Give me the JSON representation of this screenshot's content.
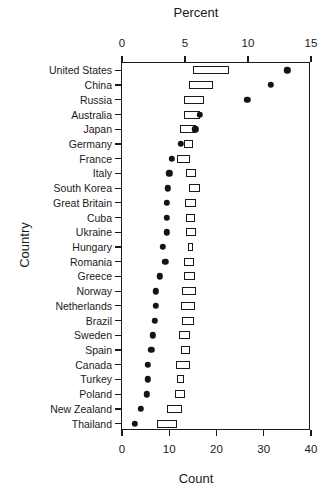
{
  "chart_data": {
    "type": "bar",
    "title": "",
    "xlabel": "Count",
    "ylabel": "Country",
    "top_axis_label": "Percent",
    "bottom_axis_label": "Count",
    "categories": [
      "United States",
      "China",
      "Russia",
      "Australia",
      "Japan",
      "Germany",
      "France",
      "Italy",
      "South Korea",
      "Great Britain",
      "Cuba",
      "Ukraine",
      "Hungary",
      "Romania",
      "Greece",
      "Norway",
      "Netherlands",
      "Brazil",
      "Sweden",
      "Spain",
      "Canada",
      "Turkey",
      "Poland",
      "New Zealand",
      "Thailand"
    ],
    "percent_axis": {
      "label": "Percent",
      "ticks": [
        0,
        5,
        10,
        15
      ],
      "tick_labels": [
        "0",
        "5",
        "10",
        "15"
      ],
      "min": 0,
      "max": 15
    },
    "count_axis": {
      "label": "Count",
      "ticks": [
        0,
        10,
        20,
        30,
        40
      ],
      "tick_labels": [
        "0",
        "10",
        "20",
        "30",
        "40"
      ],
      "min": 0,
      "max": 40
    },
    "grid": false,
    "legend": null,
    "series": [
      {
        "name": "Percent range (bar)",
        "unit": "percent",
        "axis": "top",
        "values": [
          [
            5.6,
            8.5
          ],
          [
            5.3,
            7.2
          ],
          [
            4.9,
            6.5
          ],
          [
            4.9,
            6.2
          ],
          [
            4.6,
            5.9
          ],
          [
            4.9,
            5.6
          ],
          [
            4.4,
            5.4
          ],
          [
            5.1,
            5.9
          ],
          [
            5.3,
            6.2
          ],
          [
            5.0,
            5.9
          ],
          [
            5.1,
            5.8
          ],
          [
            5.1,
            5.9
          ],
          [
            5.2,
            5.6
          ],
          [
            4.9,
            5.7
          ],
          [
            4.9,
            5.8
          ],
          [
            4.8,
            5.9
          ],
          [
            4.7,
            5.8
          ],
          [
            4.8,
            5.7
          ],
          [
            4.5,
            5.4
          ],
          [
            4.7,
            5.4
          ],
          [
            4.3,
            5.4
          ],
          [
            4.4,
            4.9
          ],
          [
            4.2,
            5.0
          ],
          [
            3.6,
            4.8
          ],
          [
            2.8,
            4.4
          ]
        ]
      },
      {
        "name": "Count (dot)",
        "unit": "count",
        "axis": "bottom",
        "values": [
          35.0,
          31.5,
          26.5,
          16.5,
          15.5,
          12.5,
          10.5,
          10.0,
          9.7,
          9.5,
          9.5,
          9.5,
          8.7,
          9.2,
          8.0,
          7.2,
          7.2,
          7.0,
          6.5,
          6.2,
          5.5,
          5.5,
          5.3,
          4.0,
          2.7
        ]
      }
    ]
  },
  "bar_color": "#ffffff",
  "bar_edge_color": "#1a1a1a",
  "dot_color": "#141414"
}
